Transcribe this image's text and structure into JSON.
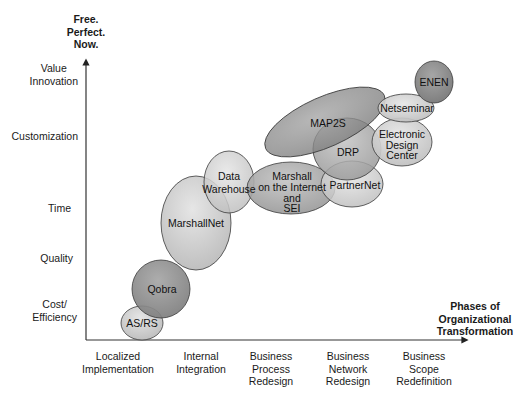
{
  "y_axis": {
    "title_lines": [
      "Free.",
      "Perfect.",
      "Now."
    ],
    "levels": [
      {
        "lines": [
          "Value",
          "Innovation"
        ]
      },
      {
        "lines": [
          "Customization"
        ]
      },
      {
        "lines": [
          "Time"
        ]
      },
      {
        "lines": [
          "Quality"
        ]
      },
      {
        "lines": [
          "Cost/",
          "Efficiency"
        ]
      }
    ]
  },
  "x_axis": {
    "title_lines": [
      "Phases of",
      "Organizational",
      "Transformation"
    ],
    "phases": [
      {
        "lines": [
          "Localized",
          "Implementation"
        ]
      },
      {
        "lines": [
          "Internal",
          "Integration"
        ]
      },
      {
        "lines": [
          "Business",
          "Process",
          "Redesign"
        ]
      },
      {
        "lines": [
          "Business",
          "Network",
          "Redesign"
        ]
      },
      {
        "lines": [
          "Business",
          "Scope",
          "Redefinition"
        ]
      }
    ]
  },
  "ellipses": [
    {
      "name": "AS/RS",
      "lines": [
        "AS/RS"
      ],
      "shade": "light"
    },
    {
      "name": "Qobra",
      "lines": [
        "Qobra"
      ],
      "shade": "dark"
    },
    {
      "name": "MarshallNet",
      "lines": [
        "MarshallNet"
      ],
      "shade": "light"
    },
    {
      "name": "Data Warehouse",
      "lines": [
        "Data",
        "Warehouse"
      ],
      "shade": "light"
    },
    {
      "name": "Marshall on the Internet and SEI",
      "lines": [
        "Marshall",
        "on the Internet",
        "and",
        "SEI"
      ],
      "shade": "medium"
    },
    {
      "name": "PartnerNet",
      "lines": [
        "PartnerNet"
      ],
      "shade": "light"
    },
    {
      "name": "DRP",
      "lines": [
        "DRP"
      ],
      "shade": "medium"
    },
    {
      "name": "MAP2S",
      "lines": [
        "MAP2S"
      ],
      "shade": "dark"
    },
    {
      "name": "Electronic Design Center",
      "lines": [
        "Electronic",
        "Design",
        "Center"
      ],
      "shade": "light"
    },
    {
      "name": "Netseminar",
      "lines": [
        "Netseminar"
      ],
      "shade": "light"
    },
    {
      "name": "ENEN",
      "lines": [
        "ENEN"
      ],
      "shade": "dark"
    }
  ],
  "colors": {
    "light": "#cfcfcf",
    "medium": "#a8a8a8",
    "dark": "#8e8e8e",
    "stroke": "#3a3a3a",
    "axis": "#333333"
  }
}
